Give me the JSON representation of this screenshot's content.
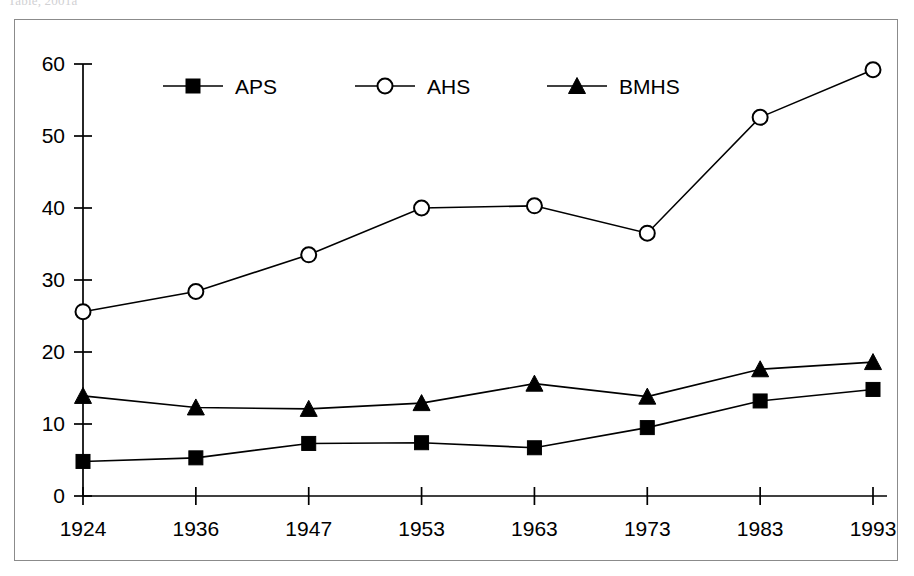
{
  "page": {
    "caption_sliver": "Table, 2001a"
  },
  "chart_data": {
    "type": "line",
    "title": "",
    "subtitle": "",
    "xlabel": "",
    "ylabel": "",
    "categories": [
      "1924",
      "1936",
      "1947",
      "1953",
      "1963",
      "1973",
      "1983",
      "1993"
    ],
    "series": [
      {
        "name": "APS",
        "marker": "filled-square",
        "color": "#000000",
        "values": [
          4.8,
          5.3,
          7.3,
          7.4,
          6.7,
          9.5,
          13.2,
          14.8
        ]
      },
      {
        "name": "AHS",
        "marker": "open-circle",
        "color": "#000000",
        "values": [
          25.6,
          28.4,
          33.5,
          40.0,
          40.3,
          36.5,
          52.6,
          59.2
        ]
      },
      {
        "name": "BMHS",
        "marker": "filled-triangle",
        "color": "#000000",
        "values": [
          13.9,
          12.3,
          12.1,
          12.9,
          15.6,
          13.8,
          17.6,
          18.6
        ]
      }
    ],
    "ylim": [
      0,
      60
    ],
    "yticks": [
      0,
      10,
      20,
      30,
      40,
      50,
      60
    ],
    "ytick_labels": [
      "0",
      "10",
      "20",
      "30",
      "40",
      "50",
      "60"
    ],
    "grid": false,
    "legend_position": "top-inside"
  },
  "legend": {
    "items": [
      {
        "label": "APS",
        "marker": "filled-square"
      },
      {
        "label": "AHS",
        "marker": "open-circle"
      },
      {
        "label": "BMHS",
        "marker": "filled-triangle"
      }
    ]
  }
}
